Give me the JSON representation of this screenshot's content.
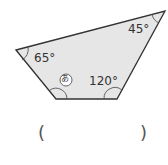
{
  "figure": {
    "shape": "quadrilateral",
    "fill": "#e6e6e6",
    "stroke": "#333333",
    "vertices": [
      [
        16,
        50
      ],
      [
        165,
        11
      ],
      [
        117,
        99
      ],
      [
        56,
        99
      ]
    ],
    "angles": {
      "left": "65°",
      "top_right": "45°",
      "bottom_right": "120°",
      "bottom_left_marker": "あ"
    }
  },
  "answer": {
    "open_paren": "(",
    "close_paren": ")",
    "value": ""
  }
}
